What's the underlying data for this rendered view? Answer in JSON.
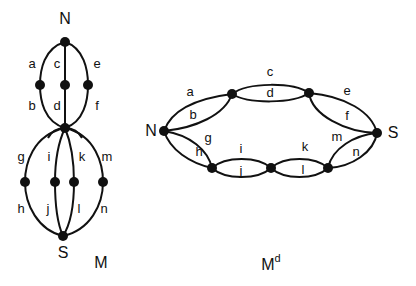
{
  "graph_M": {
    "caption": "M",
    "terminal_top": "N",
    "terminal_bottom": "S",
    "edges": [
      "a",
      "b",
      "c",
      "d",
      "e",
      "f",
      "g",
      "h",
      "i",
      "j",
      "k",
      "l",
      "m",
      "n"
    ]
  },
  "graph_Md": {
    "caption_base": "M",
    "caption_sup": "d",
    "terminal_left": "N",
    "terminal_right": "S",
    "edges": [
      "a",
      "b",
      "c",
      "d",
      "e",
      "f",
      "g",
      "h",
      "i",
      "j",
      "k",
      "l",
      "m",
      "n"
    ]
  }
}
